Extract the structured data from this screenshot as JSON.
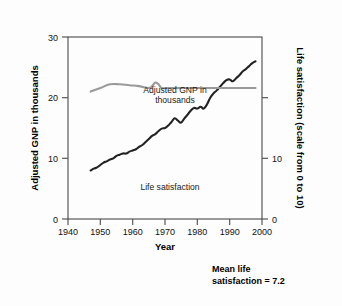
{
  "chart_data": {
    "type": "line",
    "title": "",
    "xlabel": "Year",
    "ylabel": "Adjusted GNP in thousands",
    "y2label": "Life satisfaction (scale from 0 to 10)",
    "xlim": [
      1940,
      2000
    ],
    "ylim": [
      0,
      30
    ],
    "y2lim": [
      0,
      10
    ],
    "grid": false,
    "legend": "inline-annotations",
    "xticks": [
      1940,
      1950,
      1960,
      1970,
      1980,
      1990,
      2000
    ],
    "xtick_labels": [
      "1940",
      "1950",
      "1960",
      "1970",
      "1980",
      "1990",
      "2000"
    ],
    "yticks": [
      0,
      10,
      20,
      30
    ],
    "ytick_labels": [
      "0",
      "10",
      "20",
      "30"
    ],
    "y2ticks": [
      0,
      10
    ],
    "y2tick_labels": [
      "0",
      "10"
    ],
    "annotations": [
      {
        "text_line1": "Adjusted GNP in",
        "text_line2": "thousands",
        "x": 1971,
        "y": 21.5
      },
      {
        "text": "Life satisfaction",
        "x": 1972,
        "y": 4.6
      }
    ],
    "note": {
      "line1": "Mean life",
      "line2": "satisfaction = 7.2"
    },
    "series": [
      {
        "name": "Adjusted GNP in thousands",
        "axis": "left",
        "color": "#222222",
        "x": [
          1947,
          1948,
          1949,
          1950,
          1951,
          1952,
          1953,
          1954,
          1955,
          1956,
          1957,
          1958,
          1959,
          1960,
          1961,
          1962,
          1963,
          1964,
          1965,
          1966,
          1967,
          1968,
          1969,
          1970,
          1971,
          1972,
          1973,
          1974,
          1975,
          1976,
          1977,
          1978,
          1979,
          1980,
          1981,
          1982,
          1983,
          1984,
          1985,
          1986,
          1987,
          1988,
          1989,
          1990,
          1991,
          1992,
          1993,
          1994,
          1995,
          1996,
          1997,
          1998
        ],
        "values": [
          8.0,
          8.3,
          8.5,
          8.9,
          9.3,
          9.5,
          9.8,
          10.0,
          10.4,
          10.6,
          10.8,
          10.8,
          11.1,
          11.3,
          11.5,
          11.9,
          12.2,
          12.7,
          13.2,
          13.7,
          14.0,
          14.5,
          14.9,
          15.0,
          15.4,
          16.0,
          16.6,
          16.2,
          15.9,
          16.6,
          17.2,
          17.9,
          18.3,
          18.2,
          18.5,
          18.2,
          18.9,
          20.0,
          20.7,
          21.2,
          21.8,
          22.4,
          22.9,
          23.0,
          22.7,
          23.2,
          23.7,
          24.3,
          24.7,
          25.2,
          25.7,
          26.0
        ]
      },
      {
        "name": "Life satisfaction",
        "axis": "right",
        "color": "#9a9a9a",
        "x": [
          1947,
          1950,
          1953,
          1956,
          1959,
          1962,
          1965,
          1966,
          1967,
          1968,
          1969,
          1971,
          1974,
          1978,
          1982,
          1986,
          1990,
          1994,
          1998
        ],
        "values": [
          7.0,
          7.2,
          7.4,
          7.4,
          7.35,
          7.3,
          7.2,
          7.3,
          7.5,
          7.4,
          7.2,
          7.2,
          7.2,
          7.2,
          7.2,
          7.2,
          7.2,
          7.2,
          7.2
        ]
      }
    ]
  }
}
